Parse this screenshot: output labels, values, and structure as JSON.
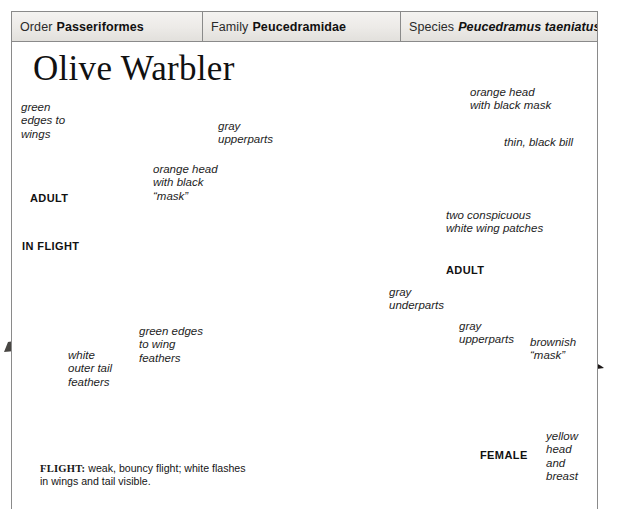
{
  "plate": {
    "title": "Olive Warbler",
    "taxonomy": [
      {
        "rank": "Order",
        "name": "Passeriformes",
        "italic": false
      },
      {
        "rank": "Family",
        "name": "Peucedramidae",
        "italic": false
      },
      {
        "rank": "Species",
        "name": "Peucedramus taeniatus",
        "italic": true
      }
    ],
    "annotations": {
      "green_edges_wings": "green\nedges to\nwings",
      "orange_head_mask_flight": "orange head\nwith black\n“mask”",
      "gray_upperparts_main": "gray\nupperparts",
      "orange_head_mask_main": "orange head\nwith black mask",
      "thin_black_bill": "thin, black bill",
      "white_wing_patches": "two conspicuous\nwhite wing patches",
      "gray_underparts": "gray\nunderparts",
      "green_edges_wing_feathers": "green edges\nto wing\nfeathers",
      "white_outer_tail": "white\nouter tail\nfeathers",
      "gray_upperparts_female": "gray\nupperparts",
      "brownish_mask": "brownish\n“mask”",
      "yellow_head_breast": "yellow\nhead\nand\nbreast"
    },
    "captions": {
      "adult_flight": "ADULT",
      "in_flight": "IN FLIGHT",
      "adult_perched": "ADULT",
      "female": "FEMALE"
    },
    "flight_note": {
      "label": "FLIGHT:",
      "text": " weak, bouncy flight; white flashes in wings and tail visible."
    },
    "colors": {
      "page_border": "#8a8a8a",
      "header_fill": "#eceae7",
      "leader_line": "#4a4a4a",
      "text": "#1a1a1a"
    }
  }
}
